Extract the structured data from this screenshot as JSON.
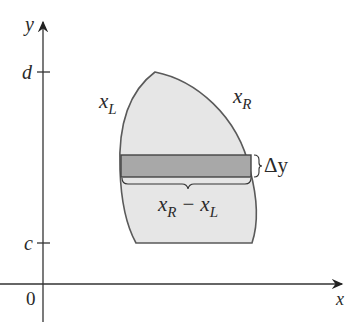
{
  "diagram": {
    "axes": {
      "x_label": "x",
      "y_label": "y",
      "origin_label": "0"
    },
    "ticks": {
      "d_label": "d",
      "c_label": "c"
    },
    "curves": {
      "left_label": "x",
      "left_sub": "L",
      "right_label": "x",
      "right_sub": "R"
    },
    "strip": {
      "height_label": "Δy",
      "width_label_a": "x",
      "width_sub_a": "R",
      "width_minus": "−",
      "width_label_b": "x",
      "width_sub_b": "L"
    },
    "colors": {
      "region_fill": "#e6e6e6",
      "strip_fill": "#a6a6a6",
      "stroke": "#555555",
      "axis": "#333333"
    }
  }
}
